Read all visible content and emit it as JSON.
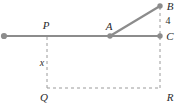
{
  "figure": {
    "type": "geometry-diagram",
    "background_color": "#ffffff",
    "stroke_color": "#8c8c8c",
    "dash_color": "#9a9a9a",
    "label_color": "#2b2b2b",
    "canvas": {
      "width": 179,
      "height": 106
    },
    "points": [
      {
        "id": "L",
        "label": "",
        "x": 4,
        "y": 36,
        "marker": true
      },
      {
        "id": "P",
        "label": "P",
        "x": 47,
        "y": 36,
        "marker": false,
        "label_x": 46,
        "label_y": 25
      },
      {
        "id": "A",
        "label": "A",
        "x": 110,
        "y": 36,
        "marker": true,
        "label_x": 109,
        "label_y": 26
      },
      {
        "id": "B",
        "label": "B",
        "x": 160,
        "y": 6,
        "marker": true,
        "label_x": 170,
        "label_y": 6
      },
      {
        "id": "C",
        "label": "C",
        "x": 160,
        "y": 36,
        "marker": true,
        "label_x": 170,
        "label_y": 36
      },
      {
        "id": "Q",
        "label": "Q",
        "x": 47,
        "y": 88,
        "marker": false,
        "label_x": 44,
        "label_y": 97
      },
      {
        "id": "R",
        "label": "R",
        "x": 160,
        "y": 88,
        "marker": false,
        "label_x": 170,
        "label_y": 97
      }
    ],
    "solid_segments": [
      {
        "name": "baseline-L-to-C",
        "x1": 4,
        "y1": 36,
        "x2": 160,
        "y2": 36
      },
      {
        "name": "segment-A-to-B",
        "x1": 110,
        "y1": 36,
        "x2": 160,
        "y2": 6
      }
    ],
    "dashed_segments": [
      {
        "name": "vertical-P-to-Q",
        "x1": 47,
        "y1": 37,
        "x2": 47,
        "y2": 88
      },
      {
        "name": "vertical-B-to-C",
        "x1": 160,
        "y1": 7,
        "x2": 160,
        "y2": 35
      },
      {
        "name": "vertical-C-to-R",
        "x1": 160,
        "y1": 37,
        "x2": 160,
        "y2": 88
      },
      {
        "name": "horizontal-Q-to-R",
        "x1": 47,
        "y1": 88,
        "x2": 160,
        "y2": 88
      }
    ],
    "measure_labels": [
      {
        "name": "height-x",
        "text": "x",
        "x": 42,
        "y": 63,
        "style": "italic"
      },
      {
        "name": "length-4",
        "text": "4",
        "x": 168,
        "y": 21,
        "style": "upright"
      }
    ]
  }
}
